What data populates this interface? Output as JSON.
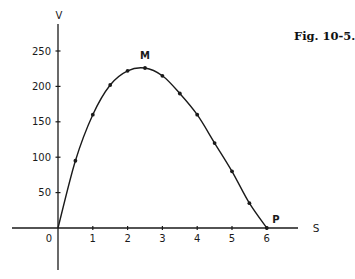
{
  "figure": {
    "caption": "Fig. 10-5."
  },
  "chart_data": {
    "type": "line",
    "title": "",
    "xlabel": "S",
    "ylabel": "V",
    "x": [
      0,
      0.5,
      1,
      1.5,
      2,
      2.5,
      3,
      3.5,
      4,
      4.5,
      5,
      5.5,
      6
    ],
    "series": [
      {
        "name": "V vs S",
        "values": [
          0,
          95,
          160,
          202,
          222,
          226,
          215,
          190,
          160,
          120,
          80,
          35,
          0
        ],
        "markers": true
      }
    ],
    "xticks": [
      1,
      2,
      3,
      4,
      5,
      6
    ],
    "xtick_labels": [
      "1",
      "2",
      "3",
      "4",
      "5",
      "6"
    ],
    "yticks": [
      50,
      100,
      150,
      200,
      250
    ],
    "ytick_labels": [
      "50",
      "100",
      "150",
      "200",
      "250"
    ],
    "origin_label": "0",
    "xlim": [
      -1.2,
      8
    ],
    "ylim": [
      -55,
      275
    ],
    "grid": false,
    "legend": "none",
    "annotations": [
      {
        "label": "M",
        "x": 2.5,
        "y": 226,
        "note": "maximum point"
      },
      {
        "label": "P",
        "x": 6,
        "y": 0,
        "note": "end point on S axis"
      }
    ],
    "colors": {
      "line": "#1a1a1a",
      "axis": "#1a1a1a"
    }
  }
}
